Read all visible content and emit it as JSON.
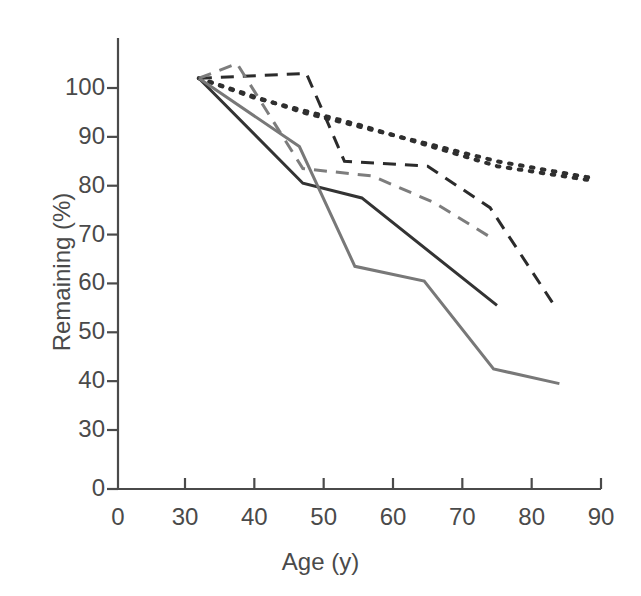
{
  "chart_data": {
    "type": "line",
    "title": "",
    "xlabel": "Age (y)",
    "ylabel": "Remaining (%)",
    "xlim": [
      0,
      90
    ],
    "ylim": [
      0,
      110
    ],
    "xticks": [
      0,
      30,
      40,
      50,
      60,
      70,
      80,
      90
    ],
    "xtick_labels": [
      "0",
      "30",
      "40",
      "50",
      "60",
      "70",
      "80",
      "90"
    ],
    "yticks": [
      0,
      30,
      40,
      50,
      60,
      70,
      80,
      90,
      100
    ],
    "ytick_labels": [
      "0",
      "30",
      "40",
      "50",
      "60",
      "70",
      "80",
      "90",
      "100"
    ],
    "y_axis_break": true,
    "grid": false,
    "legend": "none",
    "series": [
      {
        "name": "dotted-upper",
        "style": "dotted",
        "color": "#2f2f2f",
        "x": [
          32,
          47,
          75,
          89
        ],
        "y": [
          102,
          95,
          85,
          81.5
        ]
      },
      {
        "name": "dotted-lower",
        "style": "dotted",
        "color": "#2f2f2f",
        "x": [
          32,
          40,
          55,
          75,
          89
        ],
        "y": [
          102,
          98,
          92.5,
          84,
          81
        ]
      },
      {
        "name": "dark-dashed",
        "style": "dashed",
        "color": "#2b2b2b",
        "x": [
          32,
          47.5,
          53,
          65,
          74,
          83.5
        ],
        "y": [
          102,
          103,
          85,
          84,
          75.5,
          55
        ]
      },
      {
        "name": "gray-dashed",
        "style": "dashed",
        "color": "#7d7d7d",
        "x": [
          32,
          37.5,
          47,
          57,
          66,
          74
        ],
        "y": [
          102,
          105,
          83.5,
          82,
          76.5,
          69.5
        ]
      },
      {
        "name": "dark-solid",
        "style": "solid",
        "color": "#333333",
        "x": [
          32,
          47,
          55.5,
          75
        ],
        "y": [
          102,
          80.5,
          77.5,
          55.5
        ]
      },
      {
        "name": "gray-solid",
        "style": "solid",
        "color": "#787878",
        "x": [
          32,
          46.5,
          54.5,
          64.5,
          74.5,
          84
        ],
        "y": [
          102,
          88,
          63.5,
          60.5,
          42.5,
          39.5
        ]
      }
    ]
  }
}
